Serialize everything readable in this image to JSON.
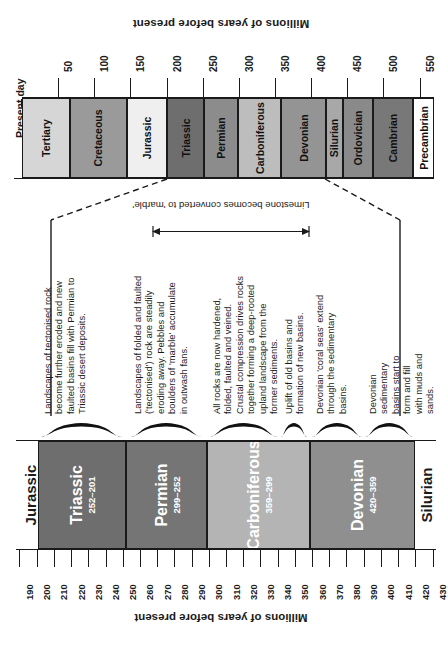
{
  "top_chart": {
    "axis_title": "Millions of years before present",
    "present_day_label": "Present day",
    "axis_ticks": [
      50,
      100,
      150,
      200,
      250,
      300,
      350,
      400,
      450,
      500,
      550
    ],
    "axis_min": 0,
    "axis_max": 570,
    "periods": [
      {
        "name": "Tertiary",
        "start": 0,
        "end": 66,
        "color": "#d6d6d6"
      },
      {
        "name": "Cretaceous",
        "start": 66,
        "end": 145,
        "color": "#9a9a9a"
      },
      {
        "name": "Jurassic",
        "start": 145,
        "end": 201,
        "color": "#efefef"
      },
      {
        "name": "Triassic",
        "start": 201,
        "end": 252,
        "color": "#6e6e6e"
      },
      {
        "name": "Permian",
        "start": 252,
        "end": 299,
        "color": "#8c8c8c"
      },
      {
        "name": "Carboniferous",
        "start": 299,
        "end": 359,
        "color": "#bdbdbd"
      },
      {
        "name": "Devonian",
        "start": 359,
        "end": 420,
        "color": "#949494"
      },
      {
        "name": "Silurian",
        "start": 420,
        "end": 444,
        "color": "#a8a8a8"
      },
      {
        "name": "Ordovician",
        "start": 444,
        "end": 485,
        "color": "#8a8a8a"
      },
      {
        "name": "Cambrian",
        "start": 485,
        "end": 541,
        "color": "#787878"
      },
      {
        "name": "Precambrian",
        "start": 541,
        "end": 570,
        "color": "#ffffff"
      }
    ]
  },
  "annotation": {
    "marble_note": "Limestone becomes\nconverted to 'marble'"
  },
  "descriptions": [
    {
      "id": "tectonised-erosion",
      "text": "Landscapes of tectonised rock\nbecome further eroded and new\nfaulted basins fill with Permian to\nTriassic desert deposits."
    },
    {
      "id": "folded-faulted-erosion",
      "text": "Landscapes of folded and faulted\n('tectonised') rock are steadily\neroding away. Pebbles and\nboulders of 'marble' accumulate\nin outwash fans."
    },
    {
      "id": "hardened-folded-faulted",
      "text": "All rocks are now hardened,\nfolded, faulted and veined.\nCrustal compression drives rocks\ntogether forming a deep-rooted\nupland landscape from the\nformer sediments."
    },
    {
      "id": "uplift-new-basins",
      "text": "Uplift of old basins and\nformation of new basins."
    },
    {
      "id": "devonian-coral-seas",
      "text": "Devonian 'coral seas' extend\nthrough the sedimentary\nbasins."
    },
    {
      "id": "devonian-basins-fill",
      "text": "Devonian sedimentary\nbasins start to form and fill\nwith muds and sands."
    }
  ],
  "bottom_chart": {
    "axis_title": "Millions of years before present",
    "axis_min": 188,
    "axis_max": 432,
    "axis_ticks": [
      190,
      200,
      210,
      220,
      230,
      240,
      250,
      260,
      270,
      280,
      290,
      300,
      310,
      320,
      330,
      340,
      350,
      360,
      370,
      380,
      390,
      400,
      410,
      420,
      430
    ],
    "outer_labels": [
      {
        "name": "Jurassic",
        "center": 196,
        "side": "left"
      },
      {
        "name": "Silurian",
        "center": 426,
        "side": "right"
      }
    ],
    "periods": [
      {
        "name": "Triassic",
        "range": "252–201",
        "start": 201,
        "end": 252,
        "color": "#6e6e6e"
      },
      {
        "name": "Permian",
        "range": "299–252",
        "start": 252,
        "end": 299,
        "color": "#757575"
      },
      {
        "name": "Carboniferous",
        "range": "359–299",
        "start": 299,
        "end": 359,
        "color": "#b4b4b4"
      },
      {
        "name": "Devonian",
        "range": "420–359",
        "start": 359,
        "end": 420,
        "color": "#8f8f8f"
      }
    ],
    "braces": [
      {
        "desc_id": "tectonised-erosion",
        "start": 202,
        "end": 250
      },
      {
        "desc_id": "folded-faulted-erosion",
        "start": 254,
        "end": 296
      },
      {
        "desc_id": "hardened-folded-faulted",
        "start": 300,
        "end": 340
      },
      {
        "desc_id": "uplift-new-basins",
        "start": 342,
        "end": 357
      },
      {
        "desc_id": "devonian-coral-seas",
        "start": 360,
        "end": 389
      },
      {
        "desc_id": "devonian-basins-fill",
        "start": 391,
        "end": 419
      }
    ]
  },
  "chart_data": {
    "type": "bar",
    "subcharts": [
      {
        "name": "full-timescale",
        "xlabel": "Millions of years before present",
        "xlim": [
          0,
          570
        ],
        "xticks": [
          50,
          100,
          150,
          200,
          250,
          300,
          350,
          400,
          450,
          500,
          550
        ],
        "categories": [
          "Tertiary",
          "Cretaceous",
          "Jurassic",
          "Triassic",
          "Permian",
          "Carboniferous",
          "Devonian",
          "Silurian",
          "Ordovician",
          "Cambrian",
          "Precambrian"
        ],
        "spans": [
          [
            0,
            66
          ],
          [
            66,
            145
          ],
          [
            145,
            201
          ],
          [
            201,
            252
          ],
          [
            252,
            299
          ],
          [
            299,
            359
          ],
          [
            359,
            420
          ],
          [
            420,
            444
          ],
          [
            444,
            485
          ],
          [
            485,
            541
          ],
          [
            541,
            570
          ]
        ]
      },
      {
        "name": "detail-timescale",
        "xlabel": "Millions of years before present",
        "xlim": [
          188,
          432
        ],
        "xticks": [
          190,
          200,
          210,
          220,
          230,
          240,
          250,
          260,
          270,
          280,
          290,
          300,
          310,
          320,
          330,
          340,
          350,
          360,
          370,
          380,
          390,
          400,
          410,
          420,
          430
        ],
        "categories": [
          "Triassic",
          "Permian",
          "Carboniferous",
          "Devonian"
        ],
        "spans": [
          [
            201,
            252
          ],
          [
            252,
            299
          ],
          [
            299,
            359
          ],
          [
            359,
            420
          ]
        ],
        "labels": [
          "252–201",
          "299–252",
          "359–299",
          "420–359"
        ]
      }
    ]
  }
}
